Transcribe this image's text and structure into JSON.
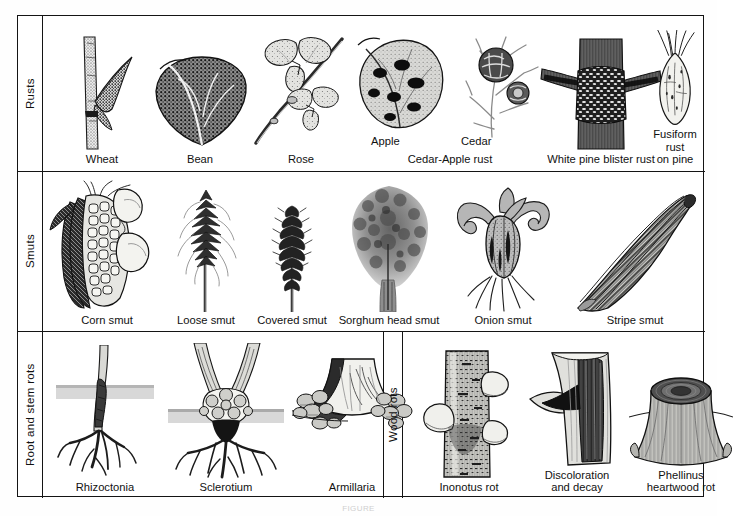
{
  "figure": {
    "bottom_caption": "FIGURE",
    "frame_color": "#141414",
    "background_color": "#ffffff",
    "rows": [
      {
        "id": "rusts",
        "category_label": "Rusts",
        "specimens": [
          {
            "id": "wheat",
            "caption": "Wheat"
          },
          {
            "id": "bean",
            "caption": "Bean"
          },
          {
            "id": "rose",
            "caption": "Rose"
          },
          {
            "id": "cedar-apple-rust",
            "caption": "Cedar-Apple rust",
            "sublabels": [
              "Apple",
              "Cedar"
            ]
          },
          {
            "id": "white-pine-blister-rust",
            "caption": "White pine blister rust"
          },
          {
            "id": "fusiform-rust-on-pine",
            "caption": "Fusiform rust\non pine"
          }
        ]
      },
      {
        "id": "smuts",
        "category_label": "Smuts",
        "specimens": [
          {
            "id": "corn-smut",
            "caption": "Corn smut"
          },
          {
            "id": "loose-smut",
            "caption": "Loose smut"
          },
          {
            "id": "covered-smut",
            "caption": "Covered smut"
          },
          {
            "id": "sorghum-head-smut",
            "caption": "Sorghum head smut"
          },
          {
            "id": "onion-smut",
            "caption": "Onion smut"
          },
          {
            "id": "stripe-smut",
            "caption": "Stripe smut"
          }
        ]
      },
      {
        "id": "root-and-stem-rots",
        "category_label": "Root and stem rots",
        "specimens": [
          {
            "id": "rhizoctonia",
            "caption": "Rhizoctonia"
          },
          {
            "id": "sclerotium",
            "caption": "Sclerotium"
          },
          {
            "id": "armillaria",
            "caption": "Armillaria"
          }
        ]
      },
      {
        "id": "wood-rots",
        "category_label": "Wood rots",
        "specimens": [
          {
            "id": "inonotus-rot",
            "caption": "Inonotus rot"
          },
          {
            "id": "discoloration-and-decay",
            "caption": "Discoloration\nand decay"
          },
          {
            "id": "phellinus-heartwood-rot",
            "caption": "Phellinus\nheartwood rot"
          }
        ]
      }
    ]
  }
}
